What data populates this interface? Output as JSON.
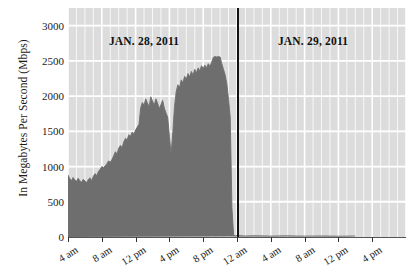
{
  "chart_data": {
    "type": "area",
    "title": "",
    "subtitle": "",
    "xlabel": "",
    "ylabel": "In Megabytes Per Second (Mbps)",
    "ylim": [
      0,
      3250
    ],
    "yticks": [
      0,
      500,
      1000,
      1500,
      2000,
      2500,
      3000
    ],
    "ytick_labels": [
      "0",
      "500",
      "1000",
      "1500",
      "2000",
      "2500",
      "3000"
    ],
    "xlim_hours": [
      4,
      44
    ],
    "xticks_hours": [
      4,
      8,
      12,
      16,
      20,
      24,
      28,
      32,
      36,
      40
    ],
    "xtick_labels": [
      "4 am",
      "8 am",
      "12 pm",
      "4 pm",
      "8 pm",
      "12 am",
      "4 am",
      "8 am",
      "12 pm",
      "4 pm"
    ],
    "grid": true,
    "legend": "none",
    "annotations": [
      {
        "text": "JAN. 28, 2011",
        "hour": 13.0,
        "value": 2780
      },
      {
        "text": "JAN. 29, 2011",
        "hour": 33.0,
        "value": 2780
      }
    ],
    "divider_hour": 24,
    "series": [
      {
        "name": "Egypt internet traffic",
        "color": "#6e6e6e",
        "x_hours": [
          4.0,
          4.2,
          4.4,
          4.6,
          4.8,
          5.0,
          5.2,
          5.4,
          5.6,
          5.8,
          6.0,
          6.2,
          6.4,
          6.6,
          6.8,
          7.0,
          7.2,
          7.4,
          7.6,
          7.8,
          8.0,
          8.2,
          8.4,
          8.6,
          8.8,
          9.0,
          9.2,
          9.4,
          9.6,
          9.8,
          10.0,
          10.2,
          10.4,
          10.6,
          10.8,
          11.0,
          11.2,
          11.4,
          11.6,
          11.8,
          12.0,
          12.2,
          12.4,
          12.6,
          12.8,
          13.0,
          13.2,
          13.4,
          13.6,
          13.8,
          14.0,
          14.2,
          14.4,
          14.6,
          14.8,
          15.0,
          15.2,
          15.4,
          15.6,
          15.8,
          16.0,
          16.2,
          16.4,
          16.6,
          16.8,
          17.0,
          17.2,
          17.4,
          17.6,
          17.8,
          18.0,
          18.2,
          18.4,
          18.6,
          18.8,
          19.0,
          19.2,
          19.4,
          19.6,
          19.8,
          20.0,
          20.2,
          20.4,
          20.6,
          20.8,
          21.0,
          21.2,
          21.4,
          21.6,
          21.8,
          22.0,
          22.2,
          22.4,
          22.6,
          22.8,
          23.0,
          23.2,
          23.4,
          23.6,
          23.8,
          23.95,
          24.0,
          24.2,
          25.0,
          26.0,
          28.0,
          30.0,
          32.0,
          34.0,
          36.0,
          38.0,
          40.0,
          42.0,
          44.0
        ],
        "values": [
          880,
          830,
          800,
          845,
          810,
          790,
          835,
          800,
          775,
          820,
          795,
          770,
          815,
          840,
          800,
          860,
          900,
          870,
          930,
          960,
          1000,
          985,
          1010,
          1040,
          1080,
          1060,
          1100,
          1150,
          1210,
          1180,
          1260,
          1300,
          1270,
          1350,
          1400,
          1380,
          1450,
          1430,
          1490,
          1460,
          1520,
          1560,
          1600,
          1830,
          1910,
          1870,
          1960,
          1900,
          1850,
          1990,
          1930,
          1870,
          1960,
          1900,
          1820,
          1880,
          1940,
          1830,
          1760,
          1700,
          1430,
          1180,
          1480,
          1850,
          2060,
          2160,
          2120,
          2230,
          2190,
          2280,
          2240,
          2320,
          2270,
          2350,
          2300,
          2380,
          2330,
          2400,
          2360,
          2430,
          2390,
          2440,
          2400,
          2460,
          2420,
          2480,
          2550,
          2560,
          2555,
          2560,
          2555,
          2460,
          2380,
          2300,
          2170,
          1950,
          1700,
          420,
          25,
          18,
          22,
          16,
          19,
          14,
          17,
          13,
          16,
          12,
          15,
          11,
          14
        ]
      }
    ]
  }
}
